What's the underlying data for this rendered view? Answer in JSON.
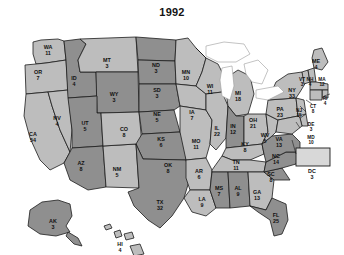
{
  "title": "1992",
  "map": {
    "name": "united-states-electoral-map",
    "colors": {
      "bush_states": "#8f8f8f",
      "clinton_states": "#bdbdbd",
      "border": "#1c1c1c",
      "lakes": "#ffffff",
      "background": "#ffffff",
      "label_text": "#101010"
    }
  },
  "chart_data": {
    "type": "map",
    "title": "1992",
    "subtitle": "",
    "xlabel": "",
    "ylabel": "",
    "legend_position": "none",
    "grid": false,
    "value_label": "electoral votes",
    "total_electoral_votes": 538,
    "series": [
      {
        "name": "Clinton (light)",
        "tone": "light"
      },
      {
        "name": "Bush (dark)",
        "tone": "dark"
      }
    ],
    "categories": [
      "WA",
      "OR",
      "CA",
      "NV",
      "ID",
      "MT",
      "WY",
      "UT",
      "AZ",
      "NM",
      "CO",
      "ND",
      "SD",
      "NE",
      "KS",
      "OK",
      "TX",
      "MN",
      "IA",
      "MO",
      "AR",
      "LA",
      "WI",
      "IL",
      "MI",
      "IN",
      "OH",
      "KY",
      "TN",
      "MS",
      "AL",
      "GA",
      "FL",
      "SC",
      "NC",
      "VA",
      "WV",
      "PA",
      "NY",
      "VT",
      "NH",
      "ME",
      "MA",
      "RI",
      "CT",
      "NJ",
      "DE",
      "MD",
      "DC",
      "AK",
      "HI"
    ],
    "values": [
      11,
      7,
      54,
      4,
      4,
      3,
      3,
      5,
      8,
      5,
      8,
      3,
      3,
      5,
      6,
      8,
      32,
      10,
      7,
      11,
      6,
      9,
      11,
      22,
      18,
      12,
      21,
      8,
      11,
      7,
      9,
      13,
      25,
      8,
      14,
      13,
      5,
      23,
      33,
      3,
      4,
      4,
      12,
      4,
      8,
      15,
      3,
      10,
      3,
      3,
      4
    ]
  },
  "states": [
    {
      "abbr": "WA",
      "votes": "11",
      "tone": "light",
      "x": 48,
      "y": 31,
      "size": ""
    },
    {
      "abbr": "OR",
      "votes": "7",
      "tone": "light",
      "x": 38,
      "y": 56,
      "size": ""
    },
    {
      "abbr": "CA",
      "votes": "54",
      "tone": "light",
      "x": 33,
      "y": 118,
      "size": ""
    },
    {
      "abbr": "NV",
      "votes": "4",
      "tone": "light",
      "x": 57,
      "y": 102,
      "size": ""
    },
    {
      "abbr": "ID",
      "votes": "4",
      "tone": "dark",
      "x": 74,
      "y": 62,
      "size": ""
    },
    {
      "abbr": "MT",
      "votes": "3",
      "tone": "light",
      "x": 107,
      "y": 44,
      "size": ""
    },
    {
      "abbr": "WY",
      "votes": "3",
      "tone": "dark",
      "x": 114,
      "y": 78,
      "size": ""
    },
    {
      "abbr": "UT",
      "votes": "5",
      "tone": "dark",
      "x": 85,
      "y": 107,
      "size": ""
    },
    {
      "abbr": "AZ",
      "votes": "8",
      "tone": "dark",
      "x": 81,
      "y": 147,
      "size": ""
    },
    {
      "abbr": "NM",
      "votes": "5",
      "tone": "light",
      "x": 117,
      "y": 153,
      "size": ""
    },
    {
      "abbr": "CO",
      "votes": "8",
      "tone": "light",
      "x": 124,
      "y": 113,
      "size": ""
    },
    {
      "abbr": "ND",
      "votes": "3",
      "tone": "dark",
      "x": 156,
      "y": 49,
      "size": ""
    },
    {
      "abbr": "SD",
      "votes": "3",
      "tone": "dark",
      "x": 157,
      "y": 74,
      "size": ""
    },
    {
      "abbr": "NE",
      "votes": "5",
      "tone": "dark",
      "x": 157,
      "y": 98,
      "size": ""
    },
    {
      "abbr": "KS",
      "votes": "6",
      "tone": "dark",
      "x": 161,
      "y": 123,
      "size": ""
    },
    {
      "abbr": "OK",
      "votes": "8",
      "tone": "dark",
      "x": 168,
      "y": 149,
      "size": ""
    },
    {
      "abbr": "TX",
      "votes": "32",
      "tone": "dark",
      "x": 160,
      "y": 186,
      "size": ""
    },
    {
      "abbr": "MN",
      "votes": "10",
      "tone": "light",
      "x": 186,
      "y": 56,
      "size": ""
    },
    {
      "abbr": "IA",
      "votes": "7",
      "tone": "light",
      "x": 192,
      "y": 96,
      "size": ""
    },
    {
      "abbr": "MO",
      "votes": "11",
      "tone": "light",
      "x": 196,
      "y": 125,
      "size": ""
    },
    {
      "abbr": "AR",
      "votes": "6",
      "tone": "light",
      "x": 199,
      "y": 155,
      "size": ""
    },
    {
      "abbr": "LA",
      "votes": "9",
      "tone": "light",
      "x": 202,
      "y": 183,
      "size": ""
    },
    {
      "abbr": "WI",
      "votes": "11",
      "tone": "light",
      "x": 210,
      "y": 70,
      "size": ""
    },
    {
      "abbr": "IL",
      "votes": "22",
      "tone": "light",
      "x": 217,
      "y": 112,
      "size": ""
    },
    {
      "abbr": "MI",
      "votes": "18",
      "tone": "light",
      "x": 238,
      "y": 77,
      "size": ""
    },
    {
      "abbr": "IN",
      "votes": "12",
      "tone": "dark",
      "x": 233,
      "y": 110,
      "size": ""
    },
    {
      "abbr": "OH",
      "votes": "21",
      "tone": "light",
      "x": 253,
      "y": 104,
      "size": ""
    },
    {
      "abbr": "KY",
      "votes": "8",
      "tone": "light",
      "x": 245,
      "y": 128,
      "size": ""
    },
    {
      "abbr": "TN",
      "votes": "11",
      "tone": "light",
      "x": 236,
      "y": 146,
      "size": ""
    },
    {
      "abbr": "MS",
      "votes": "7",
      "tone": "dark",
      "x": 219,
      "y": 172,
      "size": ""
    },
    {
      "abbr": "AL",
      "votes": "9",
      "tone": "dark",
      "x": 238,
      "y": 172,
      "size": ""
    },
    {
      "abbr": "GA",
      "votes": "13",
      "tone": "light",
      "x": 257,
      "y": 176,
      "size": ""
    },
    {
      "abbr": "FL",
      "votes": "25",
      "tone": "dark",
      "x": 276,
      "y": 199,
      "size": ""
    },
    {
      "abbr": "SC",
      "votes": "8",
      "tone": "dark",
      "x": 271,
      "y": 158,
      "size": ""
    },
    {
      "abbr": "NC",
      "votes": "14",
      "tone": "dark",
      "x": 276,
      "y": 140,
      "size": ""
    },
    {
      "abbr": "VA",
      "votes": "13",
      "tone": "dark",
      "x": 279,
      "y": 123,
      "size": ""
    },
    {
      "abbr": "WV",
      "votes": "5",
      "tone": "light",
      "x": 265,
      "y": 119,
      "size": ""
    },
    {
      "abbr": "PA",
      "votes": "23",
      "tone": "light",
      "x": 280,
      "y": 93,
      "size": ""
    },
    {
      "abbr": "NY",
      "votes": "33",
      "tone": "light",
      "x": 292,
      "y": 74,
      "size": ""
    },
    {
      "abbr": "VT",
      "votes": "3",
      "tone": "light",
      "x": 302,
      "y": 63,
      "size": "tiny"
    },
    {
      "abbr": "NH",
      "votes": "4",
      "tone": "light",
      "x": 310,
      "y": 63,
      "size": "tiny"
    },
    {
      "abbr": "ME",
      "votes": "4",
      "tone": "light",
      "x": 316,
      "y": 45,
      "size": ""
    },
    {
      "abbr": "MA",
      "votes": "12",
      "tone": "light",
      "x": 322,
      "y": 63,
      "size": "tiny"
    },
    {
      "abbr": "RI",
      "votes": "4",
      "tone": "light",
      "x": 325,
      "y": 82,
      "size": "tiny"
    },
    {
      "abbr": "CT",
      "votes": "8",
      "tone": "light",
      "x": 313,
      "y": 90,
      "size": "tiny"
    },
    {
      "abbr": "NJ",
      "votes": "15",
      "tone": "light",
      "x": 299,
      "y": 94,
      "size": "tiny"
    },
    {
      "abbr": "DE",
      "votes": "3",
      "tone": "light",
      "x": 311,
      "y": 108,
      "size": "tiny"
    },
    {
      "abbr": "MD",
      "votes": "10",
      "tone": "light",
      "x": 311,
      "y": 121,
      "size": "tiny"
    },
    {
      "abbr": "DC",
      "votes": "3",
      "tone": "light",
      "x": 312,
      "y": 155,
      "size": ""
    },
    {
      "abbr": "AK",
      "votes": "3",
      "tone": "dark",
      "x": 53,
      "y": 205,
      "size": ""
    },
    {
      "abbr": "HI",
      "votes": "4",
      "tone": "light",
      "x": 120,
      "y": 228,
      "size": ""
    }
  ]
}
